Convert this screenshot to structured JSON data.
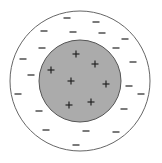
{
  "diagram": {
    "outer_circle": {
      "cx": 80,
      "cy": 81,
      "r": 70,
      "fill": "#ffffff",
      "stroke": "#666666"
    },
    "inner_circle": {
      "cx": 80,
      "cy": 81,
      "r": 41,
      "fill": "#ababab",
      "stroke": "#555555"
    },
    "plus_symbol": "+",
    "minus_symbol": "−",
    "plus_charges": [
      {
        "x": 76,
        "y": 54
      },
      {
        "x": 95,
        "y": 64
      },
      {
        "x": 51,
        "y": 70
      },
      {
        "x": 71,
        "y": 81
      },
      {
        "x": 106,
        "y": 84
      },
      {
        "x": 91,
        "y": 102
      },
      {
        "x": 69,
        "y": 105
      }
    ],
    "minus_charges": [
      {
        "x": 67,
        "y": 18
      },
      {
        "x": 96,
        "y": 22
      },
      {
        "x": 44,
        "y": 31
      },
      {
        "x": 73,
        "y": 32
      },
      {
        "x": 102,
        "y": 33
      },
      {
        "x": 125,
        "y": 39
      },
      {
        "x": 42,
        "y": 48
      },
      {
        "x": 116,
        "y": 48
      },
      {
        "x": 23,
        "y": 59
      },
      {
        "x": 133,
        "y": 62
      },
      {
        "x": 31,
        "y": 75
      },
      {
        "x": 129,
        "y": 86
      },
      {
        "x": 18,
        "y": 94
      },
      {
        "x": 141,
        "y": 94
      },
      {
        "x": 39,
        "y": 111
      },
      {
        "x": 124,
        "y": 109
      },
      {
        "x": 46,
        "y": 130
      },
      {
        "x": 86,
        "y": 131
      },
      {
        "x": 116,
        "y": 132
      },
      {
        "x": 76,
        "y": 145
      }
    ],
    "charge_color": "#222222"
  }
}
